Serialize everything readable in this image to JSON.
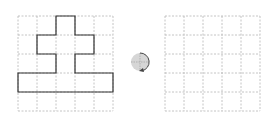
{
  "diagram": {
    "left_grid": {
      "x": 18,
      "y": 16,
      "cols": 5,
      "rows": 5,
      "cell": 19
    },
    "right_grid": {
      "x": 165,
      "y": 16,
      "cols": 5,
      "rows": 5,
      "cell": 19
    },
    "shape_cells_outline": [
      [
        2,
        0
      ],
      [
        3,
        0
      ],
      [
        3,
        1
      ],
      [
        4,
        1
      ],
      [
        4,
        2
      ],
      [
        3,
        2
      ],
      [
        3,
        3
      ],
      [
        5,
        3
      ],
      [
        5,
        4
      ],
      [
        0,
        4
      ],
      [
        0,
        3
      ],
      [
        2,
        3
      ],
      [
        2,
        2
      ],
      [
        1,
        2
      ],
      [
        1,
        1
      ],
      [
        2,
        1
      ]
    ],
    "rotation_icon": {
      "name": "rotate-clockwise-icon",
      "cx": 140,
      "cy": 62,
      "r": 9
    },
    "colors": {
      "grid": "#b5b5b5",
      "shape": "#333333",
      "circle": "#d6d6d6",
      "arrow": "#444444"
    }
  }
}
